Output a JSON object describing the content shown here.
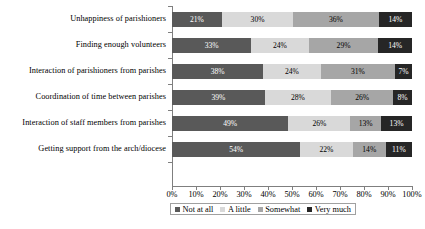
{
  "chart_data": {
    "type": "bar",
    "orientation": "horizontal",
    "stacked": true,
    "normalized_percent": true,
    "title": "",
    "subtitle": "",
    "xlabel": "",
    "ylabel": "",
    "xlim": [
      0,
      100
    ],
    "grid": false,
    "legend_position": "bottom",
    "categories": [
      "Unhappiness of parishioners",
      "Finding enough volunteers",
      "Interaction of parishioners from parishes",
      "Coordination of time between parishes",
      "Interaction of staff members from parishes",
      "Getting support from the arch/diocese"
    ],
    "series": [
      {
        "name": "Not at all",
        "color": "#595959",
        "values": [
          21,
          33,
          38,
          39,
          49,
          54
        ]
      },
      {
        "name": "A little",
        "color": "#d9d9d9",
        "values": [
          30,
          24,
          24,
          28,
          26,
          22
        ]
      },
      {
        "name": "Somewhat",
        "color": "#a6a6a6",
        "values": [
          36,
          29,
          31,
          26,
          13,
          14
        ]
      },
      {
        "name": "Very much",
        "color": "#262626",
        "values": [
          14,
          14,
          7,
          8,
          13,
          11
        ]
      }
    ],
    "data_labels": [
      [
        "21%",
        "30%",
        "36%",
        "14%"
      ],
      [
        "33%",
        "24%",
        "29%",
        "14%"
      ],
      [
        "38%",
        "24%",
        "31%",
        "7%"
      ],
      [
        "39%",
        "28%",
        "26%",
        "8%"
      ],
      [
        "49%",
        "26%",
        "13%",
        "13%"
      ],
      [
        "54%",
        "22%",
        "14%",
        "11%"
      ]
    ],
    "xticks": [
      "0%",
      "10%",
      "20%",
      "30%",
      "40%",
      "50%",
      "60%",
      "70%",
      "80%",
      "90%",
      "100%"
    ],
    "xtick_values": [
      0,
      10,
      20,
      30,
      40,
      50,
      60,
      70,
      80,
      90,
      100
    ],
    "legend": [
      {
        "label": "Not at all",
        "color": "#595959"
      },
      {
        "label": "A little",
        "color": "#d9d9d9"
      },
      {
        "label": "Somewhat",
        "color": "#a6a6a6"
      },
      {
        "label": "Very much",
        "color": "#262626"
      }
    ],
    "axis_color": "#7f7f7f"
  }
}
